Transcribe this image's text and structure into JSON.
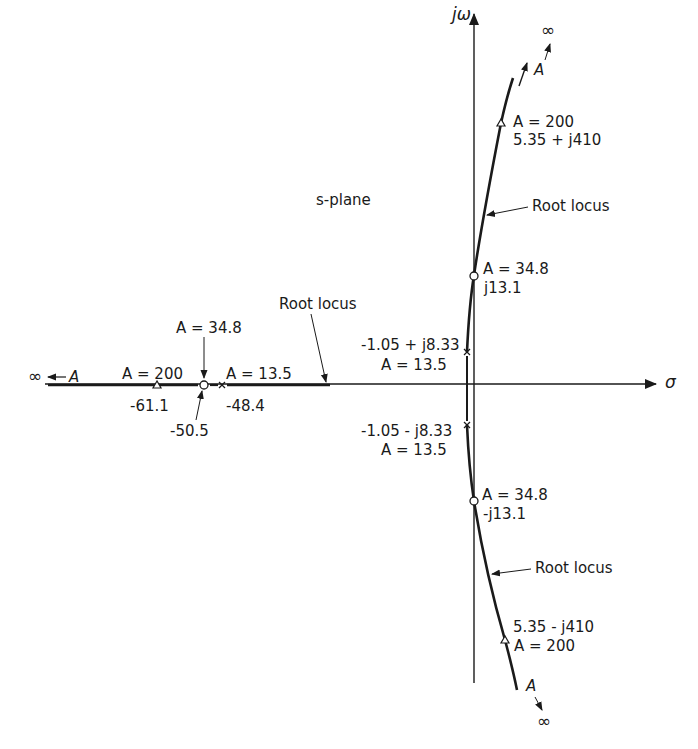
{
  "diagram": {
    "plane_label": "s-plane",
    "axes": {
      "imag_label": "jω",
      "real_label": "σ"
    },
    "annotations": {
      "root_locus_real": "Root locus",
      "root_locus_upper": "Root locus",
      "root_locus_lower": "Root locus",
      "inf_top": "∞",
      "A_top": "A",
      "inf_bottom": "∞",
      "A_bottom": "A",
      "inf_left": "∞",
      "A_left": "A"
    },
    "points": {
      "upper_tri_gain": "A = 200",
      "upper_tri_value": "5.35 + j410",
      "upper_circle_gain": "A = 34.8",
      "upper_circle_value": "j13.1",
      "upper_pole_value": "-1.05 + j8.33",
      "upper_pole_gain": "A = 13.5",
      "lower_pole_value": "-1.05 - j8.33",
      "lower_pole_gain": "A = 13.5",
      "lower_circle_gain": "A = 34.8",
      "lower_circle_value": "-j13.1",
      "lower_tri_value": "5.35 - j410",
      "lower_tri_gain": "A = 200",
      "real_tri_gain": "A = 200",
      "real_tri_value": "-61.1",
      "real_circle_gain": "A = 34.8",
      "real_circle_value": "-50.5",
      "real_pole_gain": "A = 13.5",
      "real_pole_value": "-48.4"
    },
    "legend_markers": {
      "pole": "×",
      "jw_crossing": "○",
      "A200": "△"
    }
  }
}
